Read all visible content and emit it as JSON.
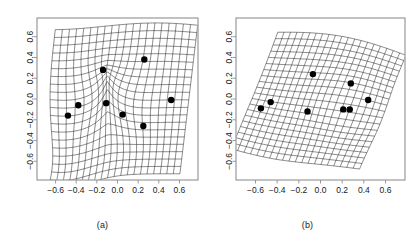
{
  "figure": {
    "type": "two-panel-deformation-grid",
    "background": "#ffffff",
    "frame_color": "#999999",
    "grid_color": "#2b2b2b",
    "point_color": "#000000",
    "tick_label_color": "#1a1a1a"
  },
  "panels": [
    {
      "id": "a",
      "caption": "(a)",
      "x_ticks": [
        "-0.6",
        "-0.4",
        "-0.2",
        "0.0",
        "0.2",
        "0.4",
        "0.6"
      ],
      "y_ticks": [
        "0.6",
        "0.4",
        "0.2",
        "0.0",
        "-0.2",
        "-0.4",
        "-0.6"
      ],
      "x_tick_values": [
        -0.6,
        -0.4,
        -0.2,
        0.0,
        0.2,
        0.4,
        0.6
      ],
      "y_tick_values": [
        0.6,
        0.4,
        0.2,
        0.0,
        -0.2,
        -0.4,
        -0.6
      ],
      "xlim": [
        -0.78,
        0.78
      ],
      "ylim": [
        -0.78,
        0.78
      ]
    },
    {
      "id": "b",
      "caption": "(b)",
      "x_ticks": [
        "-0.6",
        "-0.4",
        "-0.2",
        "0.0",
        "0.2",
        "0.4",
        "0.6"
      ],
      "y_ticks": [
        "0.6",
        "0.4",
        "0.2",
        "0.0",
        "-0.2",
        "-0.4",
        "-0.6"
      ],
      "x_tick_values": [
        -0.6,
        -0.4,
        -0.2,
        0.0,
        0.2,
        0.4,
        0.6
      ],
      "y_tick_values": [
        0.6,
        0.4,
        0.2,
        0.0,
        -0.2,
        -0.4,
        -0.6
      ],
      "xlim": [
        -0.78,
        0.78
      ],
      "ylim": [
        -0.78,
        0.78
      ]
    }
  ],
  "chart_data": [
    {
      "type": "scatter",
      "panel": "a",
      "title": "",
      "xlabel": "",
      "ylabel": "",
      "xlim": [
        -0.78,
        0.78
      ],
      "ylim": [
        -0.78,
        0.78
      ],
      "grid": true,
      "legend": "none",
      "xticks": [
        -0.6,
        -0.4,
        -0.2,
        0.0,
        0.2,
        0.4,
        0.6
      ],
      "yticks": [
        -0.6,
        -0.4,
        -0.2,
        0.0,
        0.2,
        0.4,
        0.6
      ],
      "landmarks": [
        {
          "x": -0.48,
          "y": -0.16
        },
        {
          "x": -0.38,
          "y": -0.06
        },
        {
          "x": -0.14,
          "y": 0.28
        },
        {
          "x": -0.11,
          "y": -0.04
        },
        {
          "x": 0.05,
          "y": -0.15
        },
        {
          "x": 0.26,
          "y": 0.38
        },
        {
          "x": 0.25,
          "y": -0.26
        },
        {
          "x": 0.52,
          "y": -0.01
        }
      ],
      "deformation": {
        "grid_lines_u": 21,
        "grid_lines_v": 21,
        "description": "thin-plate spline warped grid, left edge bowed, central saddle-like compression near (-0.1,-0.05)"
      }
    },
    {
      "type": "scatter",
      "panel": "b",
      "title": "",
      "xlabel": "",
      "ylabel": "",
      "xlim": [
        -0.78,
        0.78
      ],
      "ylim": [
        -0.78,
        0.78
      ],
      "grid": true,
      "legend": "none",
      "xticks": [
        -0.6,
        -0.4,
        -0.2,
        0.0,
        0.2,
        0.4,
        0.6
      ],
      "yticks": [
        -0.6,
        -0.4,
        -0.2,
        0.0,
        0.2,
        0.4,
        0.6
      ],
      "landmarks": [
        {
          "x": -0.55,
          "y": -0.09
        },
        {
          "x": -0.46,
          "y": -0.03
        },
        {
          "x": -0.12,
          "y": -0.12
        },
        {
          "x": -0.07,
          "y": 0.24
        },
        {
          "x": 0.21,
          "y": -0.1
        },
        {
          "x": 0.27,
          "y": -0.1
        },
        {
          "x": 0.28,
          "y": 0.15
        },
        {
          "x": 0.44,
          "y": -0.01
        }
      ],
      "deformation": {
        "grid_lines_u": 21,
        "grid_lines_v": 21,
        "description": "thin-plate spline warped grid, rotated/sheared rhombus with wavy top edge"
      }
    }
  ]
}
